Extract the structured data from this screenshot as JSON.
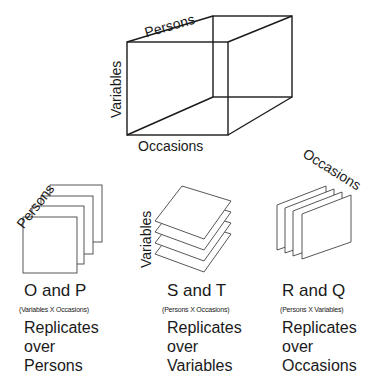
{
  "cube": {
    "axis_top": "Persons",
    "axis_left": "Variables",
    "axis_bottom": "Occasions"
  },
  "panels": [
    {
      "slice_axis": "Persons",
      "techniques": "O and P",
      "matrix": "(Variables X Occasions)",
      "desc_line1": "Replicates",
      "desc_line2": "over",
      "desc_line3": "Persons"
    },
    {
      "slice_axis": "Variables",
      "techniques": "S and T",
      "matrix": "(Persons X Occasions)",
      "desc_line1": "Replicates",
      "desc_line2": "over",
      "desc_line3": "Variables"
    },
    {
      "slice_axis": "Occasions",
      "techniques": "R and Q",
      "matrix": "(Persons X Variables)",
      "desc_line1": "Replicates",
      "desc_line2": "over",
      "desc_line3": "Occasions"
    }
  ],
  "colors": {
    "line": "#1a1a1a",
    "sheet_line": "#444444",
    "background": "#ffffff"
  }
}
